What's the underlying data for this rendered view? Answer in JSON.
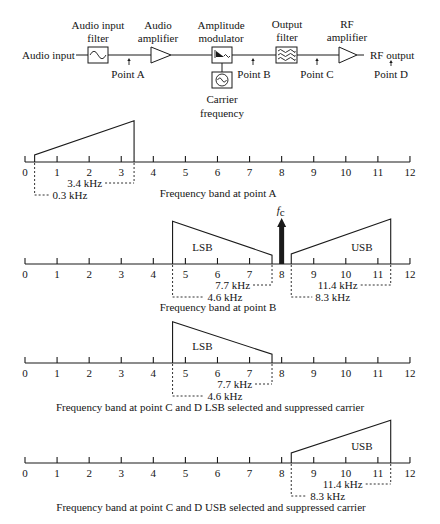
{
  "block_diagram": {
    "input_label": "Audio input",
    "output_label": "RF output",
    "blocks": [
      {
        "name": "audio-input-filter",
        "label_lines": [
          "Audio input",
          "filter"
        ],
        "icon": "bandpass-filter-icon"
      },
      {
        "name": "audio-amplifier",
        "label_lines": [
          "Audio",
          "amplifier"
        ],
        "icon": "amplifier-triangle-icon"
      },
      {
        "name": "amplitude-modulator",
        "label_lines": [
          "Amplitude",
          "modulator"
        ],
        "icon": "modulator-icon"
      },
      {
        "name": "output-filter",
        "label_lines": [
          "Output",
          "filter"
        ],
        "icon": "filter-bank-icon"
      },
      {
        "name": "rf-amplifier",
        "label_lines": [
          "RF",
          "amplifier"
        ],
        "icon": "amplifier-triangle-icon"
      }
    ],
    "carrier": {
      "label_lines": [
        "Carrier",
        "frequency"
      ],
      "icon": "sine-oscillator-icon"
    },
    "points": {
      "a": "Point A",
      "b": "Point B",
      "c": "Point C",
      "d": "Point D"
    }
  },
  "chart_data": {
    "type": "spectrum-diagram",
    "xlabel": "Frequency (kHz)",
    "xlim": [
      0,
      12
    ],
    "x_ticks": [
      0,
      1,
      2,
      3,
      4,
      5,
      6,
      7,
      8,
      9,
      10,
      11,
      12
    ],
    "tick_labels": [
      "0",
      "1",
      "2",
      "3",
      "4",
      "5",
      "6",
      "7",
      "8",
      "9",
      "10",
      "11",
      "12"
    ],
    "panels": [
      {
        "id": "point-a",
        "caption": "Frequency band at point A",
        "bands": [
          {
            "label": "",
            "start_khz": 0.3,
            "end_khz": 3.4,
            "amp_start": 0.17,
            "amp_end": 0.98
          }
        ],
        "carrier": null,
        "dimensions": [
          {
            "label": "3.4 kHz",
            "khz": 3.4,
            "row": 1,
            "side": "left",
            "label_gap_px": 32
          },
          {
            "label": "0.3 kHz",
            "khz": 0.3,
            "row": 2,
            "side": "right",
            "label_gap_px": 18
          }
        ]
      },
      {
        "id": "point-b",
        "caption": "Frequency band at point B",
        "bands": [
          {
            "label": "LSB",
            "start_khz": 4.6,
            "end_khz": 7.7,
            "amp_start": 1.02,
            "amp_end": 0.21
          },
          {
            "label": "USB",
            "start_khz": 8.3,
            "end_khz": 11.4,
            "amp_start": 0.24,
            "amp_end": 1.07
          }
        ],
        "carrier": {
          "khz": 8,
          "symbol": "f",
          "subscript": "c"
        },
        "dimensions": [
          {
            "label": "7.7 kHz",
            "khz": 7.7,
            "row": 1,
            "side": "left",
            "label_gap_px": 22
          },
          {
            "label": "4.6 kHz",
            "khz": 4.6,
            "row": 2,
            "side": "right",
            "label_gap_px": 35
          },
          {
            "label": "11.4 kHz",
            "khz": 11.4,
            "row": 1,
            "side": "left",
            "label_gap_px": 33
          },
          {
            "label": "8.3 kHz",
            "khz": 8.3,
            "row": 2,
            "side": "right",
            "label_gap_px": 24
          }
        ]
      },
      {
        "id": "point-c-d-lsb",
        "caption": "Frequency band at point C and D LSB selected and suppressed carrier",
        "bands": [
          {
            "label": "LSB",
            "start_khz": 4.6,
            "end_khz": 7.7,
            "amp_start": 0.98,
            "amp_end": 0.21
          }
        ],
        "carrier": null,
        "dimensions": [
          {
            "label": "7.7 kHz",
            "khz": 7.7,
            "row": 1,
            "side": "left",
            "label_gap_px": 20
          },
          {
            "label": "4.6 kHz",
            "khz": 4.6,
            "row": 2,
            "side": "right",
            "label_gap_px": 35
          }
        ]
      },
      {
        "id": "point-c-d-usb",
        "caption": "Frequency band at point C and D USB selected and suppressed carrier",
        "bands": [
          {
            "label": "USB",
            "start_khz": 8.3,
            "end_khz": 11.4,
            "amp_start": 0.24,
            "amp_end": 1.02
          }
        ],
        "carrier": null,
        "dimensions": [
          {
            "label": "11.4 kHz",
            "khz": 11.4,
            "row": 1,
            "side": "left",
            "label_gap_px": 28
          },
          {
            "label": "8.3 kHz",
            "khz": 8.3,
            "row": 2,
            "side": "right",
            "label_gap_px": 19
          }
        ]
      }
    ]
  }
}
